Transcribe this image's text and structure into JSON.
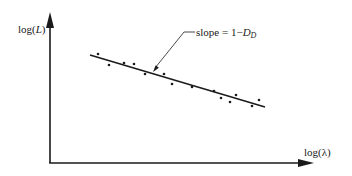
{
  "chart_data": {
    "type": "scatter",
    "title": "",
    "xlabel": "log(λ)",
    "ylabel": "log(L)",
    "xlabel_parts": {
      "prefix": "log(",
      "var": "λ",
      "suffix": ")"
    },
    "ylabel_parts": {
      "prefix": "log(",
      "var": "L",
      "suffix": ")"
    },
    "annotation": {
      "text": "slope = 1−D_D",
      "prefix": "slope = 1−",
      "var": "D",
      "sub": "D"
    },
    "grid": false,
    "legend": null,
    "axis_ticks": "none",
    "series": [
      {
        "name": "measurements",
        "kind": "points",
        "points_px": [
          [
            98,
            54
          ],
          [
            109,
            65
          ],
          [
            124,
            63
          ],
          [
            134,
            64
          ],
          [
            145,
            74
          ],
          [
            164,
            74
          ],
          [
            172,
            84
          ],
          [
            192,
            87
          ],
          [
            214,
            91
          ],
          [
            221,
            98
          ],
          [
            230,
            102
          ],
          [
            236,
            95
          ],
          [
            252,
            106
          ],
          [
            259,
            100
          ]
        ]
      },
      {
        "name": "fit",
        "kind": "line",
        "from_px": [
          90,
          55
        ],
        "to_px": [
          265,
          107
        ]
      }
    ],
    "axes_px": {
      "origin": [
        50,
        163
      ],
      "y_tip": [
        50,
        12
      ],
      "x_tip": [
        314,
        163
      ]
    },
    "leader_px": {
      "start": [
        195,
        32
      ],
      "elbow": [
        184,
        32
      ],
      "tip": [
        153,
        72
      ]
    },
    "colors": {
      "ink": "#1a1a1a",
      "background": "#ffffff"
    }
  }
}
